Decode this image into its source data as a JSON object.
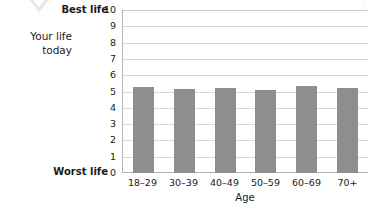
{
  "annotation": {
    "side_label_line1": "Your life",
    "side_label_line2": "today",
    "best_caption": "Best life",
    "worst_caption": "Worst life",
    "chevron_icon": "chevron-down-icon",
    "corner_icon": "corner-mark-icon"
  },
  "colors": {
    "bar": "#8e8e8e",
    "gridline": "#d8d8d8",
    "axis": "#b0b0b0",
    "text": "#1a1a1a",
    "background": "#ffffff",
    "chevron": "#e9e9e9"
  },
  "chart_data": {
    "type": "bar",
    "title": "",
    "xlabel": "Age",
    "ylabel": "",
    "categories": [
      "18–29",
      "30–39",
      "40–49",
      "50–59",
      "60–69",
      "70+"
    ],
    "values": [
      5.3,
      5.15,
      5.2,
      5.1,
      5.35,
      5.2
    ],
    "ylim": [
      0,
      10
    ],
    "yticks": [
      10,
      9,
      8,
      7,
      6,
      5,
      4,
      3,
      2,
      1,
      0
    ],
    "ytick_labels": [
      "10",
      "9",
      "8",
      "7",
      "6",
      "5",
      "4",
      "3",
      "2",
      "1",
      "0"
    ],
    "y_axis_top_caption": "Best life",
    "y_axis_bottom_caption": "Worst life",
    "grid": true,
    "grid_axis": "y",
    "legend": false,
    "legend_position": "none",
    "series": [
      {
        "name": "Your life today",
        "values": [
          5.3,
          5.15,
          5.2,
          5.1,
          5.35,
          5.2
        ]
      }
    ]
  }
}
